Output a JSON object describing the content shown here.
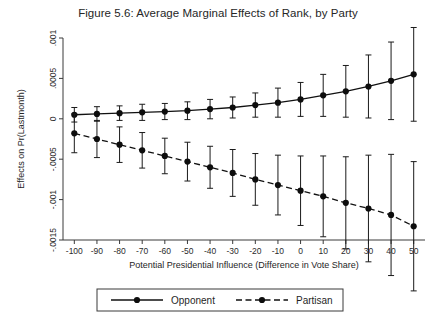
{
  "figure": {
    "title": "Figure 5.6: Average Marginal Effects of Rank, by Party",
    "background_color": "#ffffff",
    "foreground_color": "#111111"
  },
  "chart_data": {
    "type": "line",
    "title": "Figure 5.6: Average Marginal Effects of Rank, by Party",
    "xlabel": "Potential Presidential Influence (Difference in Vote Share)",
    "ylabel": "Effects on Pr(Lastmonth)",
    "xlim": [
      -105,
      55
    ],
    "ylim": [
      -0.0015,
      0.001
    ],
    "grid": false,
    "legend_position": "bottom",
    "x": [
      -100,
      -90,
      -80,
      -70,
      -60,
      -50,
      -40,
      -30,
      -20,
      -10,
      0,
      10,
      20,
      30,
      40,
      50
    ],
    "xtick_labels": [
      "-100",
      "-90",
      "-80",
      "-70",
      "-60",
      "-50",
      "-40",
      "-30",
      "-20",
      "-10",
      "0",
      "10",
      "20",
      "30",
      "40",
      "50"
    ],
    "ytick_values": [
      0.001,
      0.0005,
      0,
      -0.0005,
      -0.001,
      -0.0015
    ],
    "ytick_labels": [
      ".001",
      ".0005",
      "0",
      "-.0005",
      "-.001",
      "-.0015"
    ],
    "series": [
      {
        "name": "Opponent",
        "style": "solid",
        "marker": "filled-circle",
        "values": [
          5e-05,
          6e-05,
          7e-05,
          8e-05,
          9e-05,
          0.0001,
          0.00012,
          0.00014,
          0.00017,
          0.0002,
          0.00024,
          0.00029,
          0.00034,
          0.0004,
          0.00047,
          0.00055
        ],
        "ci_lower": [
          -4e-05,
          -3e-05,
          -2e-05,
          -2e-05,
          -1e-05,
          -1e-05,
          0.0,
          1e-05,
          2e-05,
          2e-05,
          3e-05,
          3e-05,
          2e-05,
          1e-05,
          -1e-05,
          -3e-05
        ],
        "ci_upper": [
          0.00014,
          0.00015,
          0.00016,
          0.00018,
          0.00019,
          0.00021,
          0.00024,
          0.00027,
          0.00032,
          0.00038,
          0.00045,
          0.00055,
          0.00066,
          0.00079,
          0.00095,
          0.00113
        ]
      },
      {
        "name": "Partisan",
        "style": "dashed",
        "marker": "filled-circle",
        "values": [
          -0.00018,
          -0.00025,
          -0.00032,
          -0.00039,
          -0.00046,
          -0.00053,
          -0.0006,
          -0.00067,
          -0.00075,
          -0.00082,
          -0.00089,
          -0.00096,
          -0.00104,
          -0.00111,
          -0.00119,
          -0.00133
        ],
        "ci_lower": [
          -0.00042,
          -0.00048,
          -0.00054,
          -0.00061,
          -0.00068,
          -0.00077,
          -0.00086,
          -0.00096,
          -0.00107,
          -0.00119,
          -0.00132,
          -0.00146,
          -0.00161,
          -0.00177,
          -0.00194,
          -0.00213
        ],
        "ci_upper": [
          6e-05,
          -2e-05,
          -0.0001,
          -0.00017,
          -0.00024,
          -0.00029,
          -0.00034,
          -0.00038,
          -0.00043,
          -0.00045,
          -0.00046,
          -0.00046,
          -0.00047,
          -0.00045,
          -0.00044,
          -0.00053
        ]
      }
    ],
    "legend": [
      {
        "label": "Opponent",
        "style": "solid",
        "marker": "filled-circle"
      },
      {
        "label": "Partisan",
        "style": "dashed",
        "marker": "filled-circle"
      }
    ]
  }
}
